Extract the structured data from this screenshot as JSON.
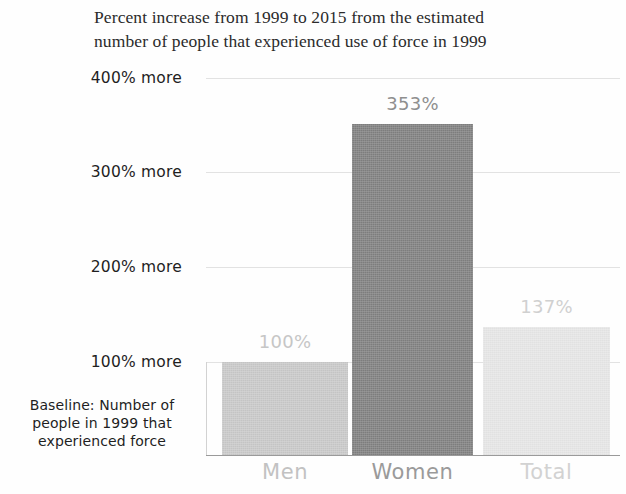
{
  "chart_data": {
    "type": "bar",
    "title": "Percent increase from 1999 to 2015 from the estimated\nnumber of people that experienced use of force in 1999",
    "categories": [
      "Men",
      "Women",
      "Total"
    ],
    "values": [
      100,
      353,
      137
    ],
    "value_labels": [
      "100%",
      "353%",
      "137%"
    ],
    "bar_colors": [
      "#c9c9c9",
      "#808080",
      "#e6e6e6"
    ],
    "category_label_colors": [
      "#c2c2c2",
      "#9a9a9a",
      "#d2d2d2"
    ],
    "value_label_colors": [
      "#c6c6c6",
      "#8f8f8f",
      "#d0d0d0"
    ],
    "xlabel": "",
    "ylabel": "",
    "ylim": [
      0,
      420
    ],
    "yticks": [
      100,
      200,
      300,
      400
    ],
    "ytick_labels": [
      "100% more",
      "200% more",
      "300% more",
      "400% more"
    ],
    "grid": true,
    "legend": "none",
    "annotation": "Baseline: Number of\npeople in 1999 that\nexperienced force"
  }
}
